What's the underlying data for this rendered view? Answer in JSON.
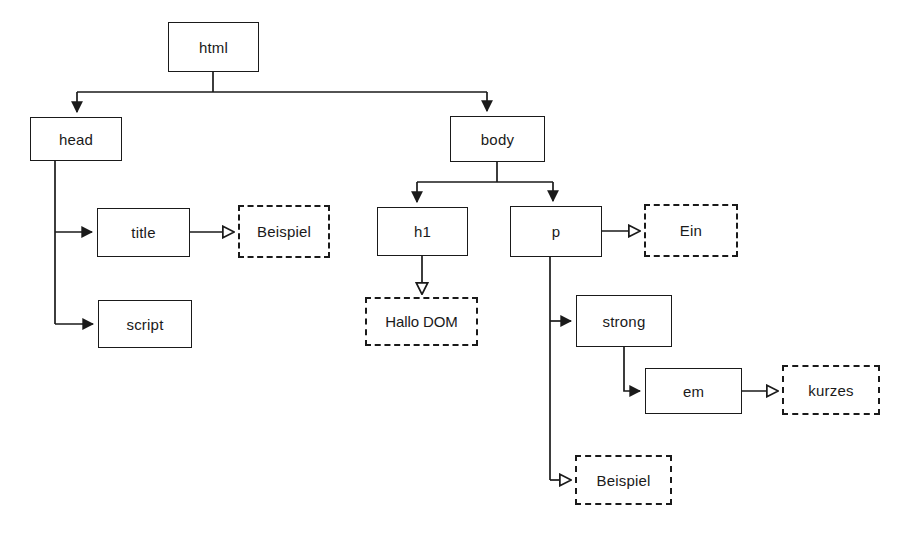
{
  "diagram": {
    "kind": "dom-tree",
    "title": "",
    "colors": {
      "stroke": "#1a1a1a",
      "background": "#ffffff",
      "text": "#1a1a1a"
    },
    "legend": {
      "element_node_style": "solid-rectangle",
      "text_node_style": "dashed-rectangle",
      "element_arrowhead": "filled-triangle",
      "text_arrowhead": "hollow-triangle"
    },
    "nodes": [
      {
        "id": "html",
        "label": "html",
        "type": "element",
        "x": 168,
        "y": 22,
        "w": 91,
        "h": 50
      },
      {
        "id": "head",
        "label": "head",
        "type": "element",
        "x": 30,
        "y": 117,
        "w": 92,
        "h": 44
      },
      {
        "id": "body",
        "label": "body",
        "type": "element",
        "x": 450,
        "y": 116,
        "w": 95,
        "h": 46
      },
      {
        "id": "title",
        "label": "title",
        "type": "element",
        "x": 97,
        "y": 208,
        "w": 93,
        "h": 49
      },
      {
        "id": "script",
        "label": "script",
        "type": "element",
        "x": 98,
        "y": 300,
        "w": 94,
        "h": 48
      },
      {
        "id": "h1",
        "label": "h1",
        "type": "element",
        "x": 377,
        "y": 207,
        "w": 91,
        "h": 49
      },
      {
        "id": "p",
        "label": "p",
        "type": "element",
        "x": 510,
        "y": 206,
        "w": 92,
        "h": 51
      },
      {
        "id": "strong",
        "label": "strong",
        "type": "element",
        "x": 576,
        "y": 295,
        "w": 96,
        "h": 52
      },
      {
        "id": "em",
        "label": "em",
        "type": "element",
        "x": 645,
        "y": 368,
        "w": 97,
        "h": 46
      },
      {
        "id": "t-title",
        "label": "Beispiel",
        "type": "text",
        "x": 238,
        "y": 205,
        "w": 92,
        "h": 53
      },
      {
        "id": "t-h1",
        "label": "Hallo DOM",
        "type": "text",
        "x": 365,
        "y": 297,
        "w": 113,
        "h": 49
      },
      {
        "id": "t-p-ein",
        "label": "Ein",
        "type": "text",
        "x": 644,
        "y": 204,
        "w": 94,
        "h": 53
      },
      {
        "id": "t-kurzes",
        "label": "kurzes",
        "type": "text",
        "x": 782,
        "y": 365,
        "w": 98,
        "h": 50
      },
      {
        "id": "t-beispiel",
        "label": "Beispiel",
        "type": "text",
        "x": 575,
        "y": 455,
        "w": 97,
        "h": 50
      }
    ],
    "edges": [
      {
        "from": "html",
        "to": "head",
        "arrow": "filled"
      },
      {
        "from": "html",
        "to": "body",
        "arrow": "filled"
      },
      {
        "from": "head",
        "to": "title",
        "arrow": "filled"
      },
      {
        "from": "head",
        "to": "script",
        "arrow": "filled"
      },
      {
        "from": "body",
        "to": "h1",
        "arrow": "filled"
      },
      {
        "from": "body",
        "to": "p",
        "arrow": "filled"
      },
      {
        "from": "title",
        "to": "t-title",
        "arrow": "hollow"
      },
      {
        "from": "h1",
        "to": "t-h1",
        "arrow": "hollow"
      },
      {
        "from": "p",
        "to": "t-p-ein",
        "arrow": "hollow"
      },
      {
        "from": "p",
        "to": "strong",
        "arrow": "filled"
      },
      {
        "from": "p",
        "to": "t-beispiel",
        "arrow": "hollow"
      },
      {
        "from": "strong",
        "to": "em",
        "arrow": "filled"
      },
      {
        "from": "em",
        "to": "t-kurzes",
        "arrow": "hollow"
      }
    ]
  }
}
